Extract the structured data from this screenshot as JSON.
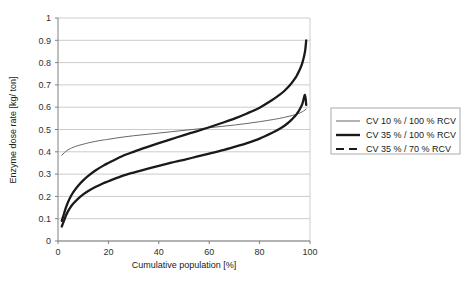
{
  "chart_data": {
    "type": "line",
    "title": "",
    "xlabel": "Cumulative population [%]",
    "ylabel": "Enzyme dose rate [kg/ ton]",
    "xlim": [
      0,
      100
    ],
    "ylim": [
      0,
      1
    ],
    "xticks": [
      "0",
      "20",
      "40",
      "60",
      "80",
      "100"
    ],
    "xtick_values": [
      0,
      20,
      40,
      60,
      80,
      100
    ],
    "yticks": [
      "0",
      "0.1",
      "0.2",
      "0.3",
      "0.4",
      "0.5",
      "0.6",
      "0.7",
      "0.8",
      "0.9",
      "1"
    ],
    "ytick_values": [
      0,
      0.1,
      0.2,
      0.3,
      0.4,
      0.5,
      0.6,
      0.7,
      0.8,
      0.9,
      1
    ],
    "grid": "horizontal",
    "legend_position": "right",
    "x": [
      1.5,
      2,
      3,
      4,
      5,
      6,
      8,
      10,
      12,
      15,
      18,
      20,
      25,
      30,
      35,
      40,
      45,
      50,
      55,
      60,
      65,
      70,
      75,
      80,
      85,
      88,
      90,
      92,
      94,
      95,
      96,
      97,
      98,
      98.5
    ],
    "series": [
      {
        "name": "CV 10 % / 100 % RCV",
        "style": "thin-solid",
        "color": "#555555",
        "values": [
          0.384,
          0.39,
          0.401,
          0.409,
          0.415,
          0.42,
          0.428,
          0.434,
          0.44,
          0.447,
          0.453,
          0.456,
          0.465,
          0.472,
          0.478,
          0.484,
          0.49,
          0.496,
          0.502,
          0.508,
          0.514,
          0.52,
          0.527,
          0.535,
          0.544,
          0.55,
          0.555,
          0.56,
          0.566,
          0.57,
          0.574,
          0.58,
          0.587,
          0.592
        ]
      },
      {
        "name": "CV 35 % / 100 % RCV",
        "style": "thick-solid",
        "color": "#1a1a1a",
        "values": [
          0.09,
          0.108,
          0.145,
          0.175,
          0.198,
          0.218,
          0.248,
          0.272,
          0.292,
          0.317,
          0.338,
          0.35,
          0.378,
          0.4,
          0.42,
          0.439,
          0.457,
          0.475,
          0.492,
          0.51,
          0.529,
          0.549,
          0.572,
          0.598,
          0.632,
          0.656,
          0.675,
          0.698,
          0.728,
          0.747,
          0.77,
          0.8,
          0.848,
          0.9
        ]
      },
      {
        "name": "CV 35 % / 70 % RCV",
        "style": "thick-dashed-legend",
        "color": "#1a1a1a",
        "values": [
          0.065,
          0.08,
          0.11,
          0.134,
          0.152,
          0.167,
          0.19,
          0.209,
          0.224,
          0.243,
          0.259,
          0.268,
          0.29,
          0.307,
          0.322,
          0.337,
          0.351,
          0.364,
          0.378,
          0.392,
          0.406,
          0.422,
          0.439,
          0.459,
          0.485,
          0.503,
          0.518,
          0.536,
          0.559,
          0.574,
          0.592,
          0.616,
          0.655,
          0.61
        ]
      }
    ]
  },
  "legend": {
    "items": [
      {
        "label": "CV 10 % / 100 % RCV",
        "marker": "thin-line-swatch"
      },
      {
        "label": "CV 35 % / 100 % RCV",
        "marker": "thick-line-swatch"
      },
      {
        "label": "CV 35 % / 70 % RCV",
        "marker": "dashed-line-swatch"
      }
    ]
  },
  "colors": {
    "grid": "#cccccc",
    "axis": "#808080",
    "text": "#202020",
    "series_thin": "#555555",
    "series_thick": "#1a1a1a",
    "legend_border": "#aaaaaa",
    "background": "#ffffff"
  }
}
